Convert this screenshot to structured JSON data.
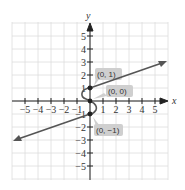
{
  "chart_data": {
    "type": "line",
    "title": "",
    "xlabel": "x",
    "ylabel": "y",
    "xlim": [
      -5.9,
      5.9
    ],
    "ylim": [
      -5.9,
      5.9
    ],
    "grid": true,
    "x_ticks": [
      -5,
      -4,
      -3,
      -2,
      -1,
      1,
      2,
      3,
      4,
      5
    ],
    "y_ticks": [
      -5,
      -4,
      -3,
      -2,
      -1,
      1,
      2,
      3,
      4,
      5
    ],
    "series": [
      {
        "name": "upper-ray",
        "points": [
          [
            0,
            1
          ],
          [
            5.7,
            2.9
          ]
        ],
        "arrow_end": true
      },
      {
        "name": "s-curve",
        "points": [
          [
            0,
            1
          ],
          [
            -0.6,
            0.5
          ],
          [
            0,
            0
          ],
          [
            0.6,
            -0.5
          ],
          [
            0,
            -1
          ]
        ]
      },
      {
        "name": "lower-ray",
        "points": [
          [
            0,
            -1
          ],
          [
            -5.7,
            -2.9
          ]
        ],
        "arrow_end": true
      }
    ],
    "marked_points": [
      {
        "x": 0,
        "y": 1,
        "label": "(0, 1)"
      },
      {
        "x": 0,
        "y": 0,
        "label": "(0, 0)"
      },
      {
        "x": 0,
        "y": -1,
        "label": "(0, −1)"
      }
    ],
    "colors": {
      "line": "#555555",
      "grid": "#dddddd",
      "axis": "#222222",
      "callout": "#cfcfcf"
    }
  },
  "labels": {
    "x_axis": "x",
    "y_axis": "y",
    "x_tick_labels": [
      "−5",
      "−4",
      "−3",
      "−2",
      "−1",
      "1",
      "2",
      "3",
      "4",
      "5"
    ],
    "y_tick_labels": [
      "5",
      "4",
      "3",
      "2",
      "1",
      "−1",
      "−2",
      "−3",
      "−4",
      "−5"
    ],
    "callouts": [
      "(0, 1)",
      "(0, 0)",
      "(0, −1)"
    ]
  }
}
